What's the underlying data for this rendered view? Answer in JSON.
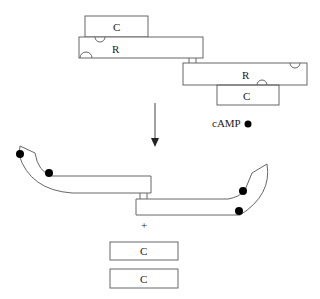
{
  "diagram": {
    "inactive_complex": {
      "top_pair": {
        "catalytic_label": "C",
        "regulatory_label": "R"
      },
      "bottom_pair": {
        "regulatory_label": "R",
        "catalytic_label": "C"
      }
    },
    "ligand": {
      "label": "cAMP",
      "symbol": "filled-circle"
    },
    "arrow": {
      "direction": "down"
    },
    "active_products": {
      "regulatory_dimer": {
        "bound_cAMP_count": 4
      },
      "plus_sign": "+",
      "free_catalytic": [
        {
          "label": "C"
        },
        {
          "label": "C"
        }
      ]
    },
    "colors": {
      "stroke": "#555555",
      "dot": "#000000",
      "background": "#ffffff"
    }
  }
}
